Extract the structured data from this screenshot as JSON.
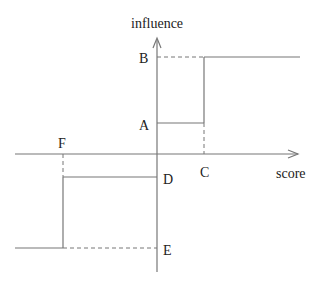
{
  "diagram": {
    "y_axis_label": "influence",
    "x_axis_label": "score",
    "points": {
      "A": "A",
      "B": "B",
      "C": "C",
      "D": "D",
      "E": "E",
      "F": "F"
    }
  }
}
